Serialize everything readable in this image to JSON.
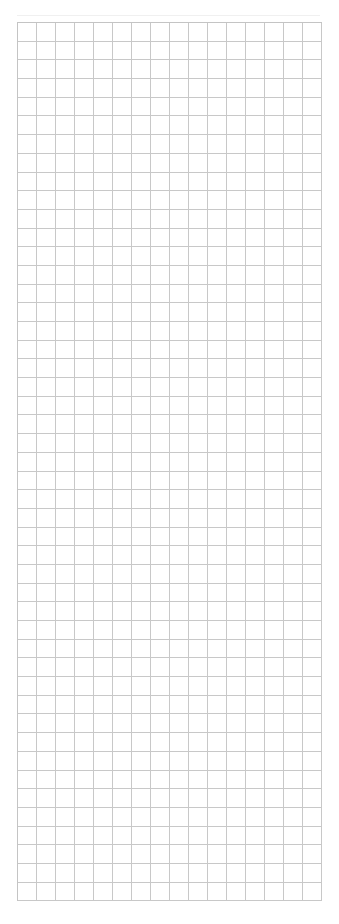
{
  "sheet": {
    "columns": 16,
    "rows": 47,
    "col_width_px": 19,
    "row_height_px": 18.7,
    "grid_line_color": "#c8c8c8",
    "cells_content": "empty"
  }
}
